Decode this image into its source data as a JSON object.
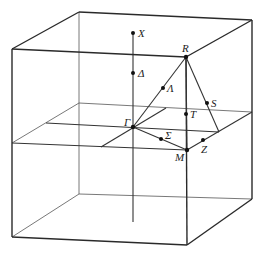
{
  "diagram": {
    "type": "brillouin-zone-cubic",
    "labels": {
      "X": "X",
      "Delta": "Δ",
      "R": "R",
      "Lambda": "Λ",
      "S": "S",
      "T": "T",
      "Gamma": "Γ",
      "Sigma": "Σ",
      "M": "M",
      "Z": "Z"
    }
  }
}
